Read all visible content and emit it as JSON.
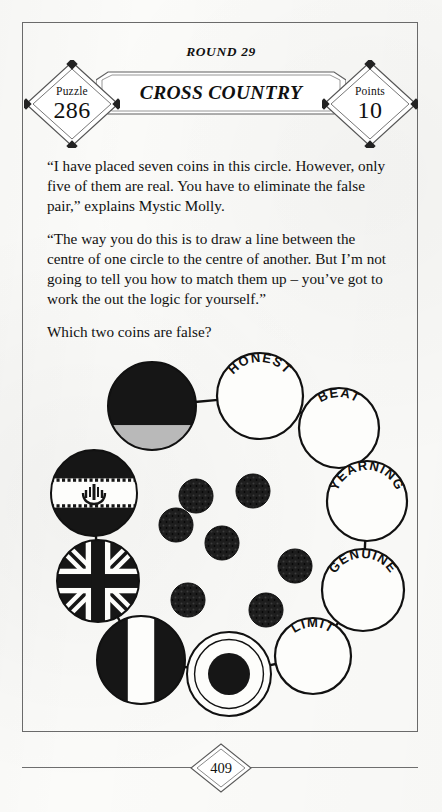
{
  "header": {
    "round_label": "ROUND 29",
    "title": "CROSS COUNTRY",
    "puzzle_caption": "Puzzle",
    "puzzle_number": "286",
    "points_caption": "Points",
    "points_value": "10"
  },
  "body": {
    "paragraph_1": "“I have placed seven coins in this circle. However, only five of them are real. You have to eliminate the false pair,” explains Mystic Molly.",
    "paragraph_2": "“The way you do this is to draw a line between the centre of one circle to the centre of another. But I’m not going to tell you how to match them up – you’ve got to work the out the logic for yourself.”",
    "paragraph_3": "Which two coins are false?"
  },
  "diagram": {
    "ring_nodes": [
      {
        "id": "node-german-flag",
        "kind": "flag",
        "flag": "horizontal-bands",
        "label": "",
        "cx": 116,
        "cy": 68,
        "r": 44
      },
      {
        "id": "node-honest",
        "kind": "word",
        "flag": "",
        "label": "HONEST",
        "cx": 224,
        "cy": 58,
        "r": 43
      },
      {
        "id": "node-beat",
        "kind": "word",
        "flag": "",
        "label": "BEAT",
        "cx": 303,
        "cy": 90,
        "r": 40
      },
      {
        "id": "node-yearning",
        "kind": "word",
        "flag": "",
        "label": "YEARNING",
        "cx": 331,
        "cy": 163,
        "r": 40
      },
      {
        "id": "node-genuine",
        "kind": "word",
        "flag": "",
        "label": "GENUINE",
        "cx": 327,
        "cy": 252,
        "r": 41
      },
      {
        "id": "node-limit",
        "kind": "word",
        "flag": "",
        "label": "LIMIT",
        "cx": 277,
        "cy": 318,
        "r": 38
      },
      {
        "id": "node-roundel",
        "kind": "flag",
        "flag": "roundel",
        "label": "",
        "cx": 193,
        "cy": 336,
        "r": 42
      },
      {
        "id": "node-vertical-tricolor",
        "kind": "flag",
        "flag": "vertical-bands",
        "label": "",
        "cx": 105,
        "cy": 322,
        "r": 44
      },
      {
        "id": "node-union-jack",
        "kind": "flag",
        "flag": "union-jack",
        "label": "",
        "cx": 62,
        "cy": 243,
        "r": 41
      },
      {
        "id": "node-iran-flag",
        "kind": "flag",
        "flag": "iran",
        "label": "",
        "cx": 58,
        "cy": 155,
        "r": 43
      }
    ],
    "coins": [
      {
        "id": "coin-1",
        "cx": 160,
        "cy": 158,
        "r": 17
      },
      {
        "id": "coin-2",
        "cx": 217,
        "cy": 153,
        "r": 17
      },
      {
        "id": "coin-3",
        "cx": 140,
        "cy": 187,
        "r": 17
      },
      {
        "id": "coin-4",
        "cx": 186,
        "cy": 205,
        "r": 17
      },
      {
        "id": "coin-5",
        "cx": 259,
        "cy": 228,
        "r": 17
      },
      {
        "id": "coin-6",
        "cx": 152,
        "cy": 262,
        "r": 17
      },
      {
        "id": "coin-7",
        "cx": 230,
        "cy": 272,
        "r": 17
      }
    ],
    "coin_count_stated": "seven",
    "real_count_stated": "five"
  },
  "footer": {
    "page_number": "409"
  },
  "colors": {
    "ink": "#111111",
    "border": "#6a6a6a",
    "paper": "#fbfbf9",
    "flag_grey": "#b9b9b9"
  }
}
